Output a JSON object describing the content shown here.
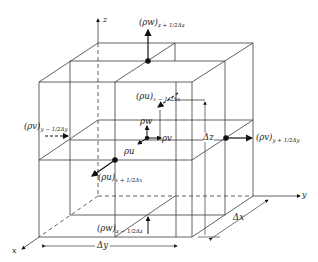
{
  "figure": {
    "type": "control-volume-diagram"
  },
  "axes": {
    "x": "x",
    "y": "y",
    "z": "z"
  },
  "fluxes": {
    "top": {
      "base": "(ρw)",
      "sub": "z + 1/2Δz"
    },
    "bottom": {
      "base": "(ρw)",
      "sub": "z − 1/2Δz"
    },
    "left": {
      "base": "(ρv)",
      "sub": "y − 1/2Δy"
    },
    "right": {
      "base": "(ρv)",
      "sub": "y + 1/2Δy"
    },
    "back": {
      "base": "(ρu)",
      "sub": "x − 1/2Δx"
    },
    "front": {
      "base": "(ρu)",
      "sub": "x + 1/2Δx"
    }
  },
  "center_components": {
    "u": "ρu",
    "v": "ρv",
    "w": "ρw"
  },
  "dimensions": {
    "dx": "Δx",
    "dy": "Δy",
    "dz": "Δz"
  },
  "colors": {
    "line": "#3a3a3a",
    "arrow": "#111111",
    "background": "#ffffff"
  }
}
